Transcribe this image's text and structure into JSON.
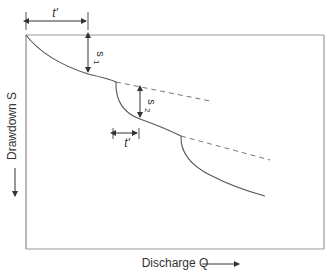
{
  "diagram": {
    "x_axis_label": "Discharge Q",
    "y_axis_label": "Drawdown S",
    "annotations": {
      "t_prime_top": "t'",
      "t_prime_mid": "t'",
      "s1": "s",
      "s1_sub": "1",
      "s2": "s",
      "s2_sub": "2"
    },
    "colors": {
      "line": "#555555",
      "dashed": "#777777",
      "frame": "#888888"
    }
  }
}
